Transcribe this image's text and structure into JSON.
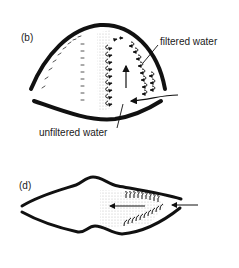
{
  "figure_b": {
    "label": "(b)",
    "annotations": {
      "filtered": "filtered water",
      "unfiltered": "unfiltered water"
    }
  },
  "figure_d": {
    "label": "(d)"
  },
  "colors": {
    "ink": "#111111",
    "stipple": "#d9d9d9",
    "background": "#ffffff"
  }
}
